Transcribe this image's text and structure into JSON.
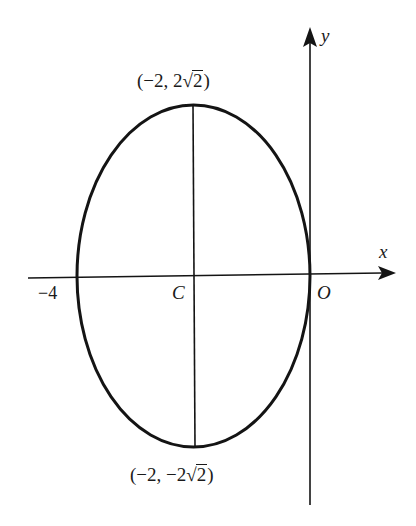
{
  "diagram": {
    "type": "ellipse-on-axes",
    "colors": {
      "stroke": "#141414",
      "text": "#1a1a1a",
      "background": "#ffffff"
    },
    "axes": {
      "x_label": "x",
      "y_label": "y",
      "origin_label": "O"
    },
    "ellipse": {
      "center_label": "C",
      "center": [
        -2,
        0
      ],
      "semi_axis_x": 2,
      "semi_axis_y": "2√2",
      "left_vertex_label": "−4",
      "top_point": {
        "prefix": "(−2, 2",
        "radicand": "2",
        "suffix": ")"
      },
      "bottom_point": {
        "prefix": "(−2, −2",
        "radicand": "2",
        "suffix": ")"
      }
    }
  }
}
